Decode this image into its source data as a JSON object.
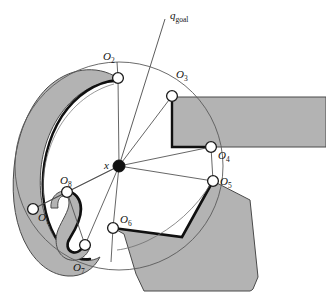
{
  "figure": {
    "type": "geometric-diagram",
    "canvas": {
      "width": 326,
      "height": 306
    },
    "colors": {
      "obstacle_fill": "#b3b3b3",
      "obstacle_stroke": "#3c3c3c",
      "highlight_stroke": "#111111",
      "ray_stroke": "#4d4d4d",
      "circle_stroke": "#555555",
      "node_fill": "#ffffff",
      "node_stroke": "#1a1a1a",
      "center_fill": "#111111",
      "background": "#ffffff"
    },
    "center": {
      "label": "x",
      "label_x": 104,
      "label_y": 160,
      "cx": 119,
      "cy": 166,
      "r": 6
    },
    "goal": {
      "label": "q",
      "sublabel": "goal",
      "label_x": 170,
      "label_y": 10,
      "line_from": {
        "x": 119,
        "y": 166
      },
      "line_to": {
        "x": 165,
        "y": 19
      }
    },
    "visibility_circle": {
      "cx": 119,
      "cy": 166,
      "r": 104
    },
    "nodes": [
      {
        "id": "O1",
        "label": "O",
        "sub": "1",
        "cx": 33,
        "cy": 209,
        "label_x": 38,
        "label_y": 212
      },
      {
        "id": "O2",
        "label": "O",
        "sub": "2",
        "cx": 118,
        "cy": 78,
        "label_x": 103,
        "label_y": 51
      },
      {
        "id": "O3",
        "label": "O",
        "sub": "3",
        "cx": 172,
        "cy": 96,
        "label_x": 176,
        "label_y": 69
      },
      {
        "id": "O4",
        "label": "O",
        "sub": "4",
        "cx": 211,
        "cy": 147,
        "label_x": 218,
        "label_y": 150
      },
      {
        "id": "O5",
        "label": "O",
        "sub": "5",
        "cx": 213,
        "cy": 181,
        "label_x": 220,
        "label_y": 176
      },
      {
        "id": "O6",
        "label": "O",
        "sub": "6",
        "cx": 113,
        "cy": 228,
        "label_x": 120,
        "label_y": 214
      },
      {
        "id": "O7",
        "label": "O",
        "sub": "7",
        "cx": 85,
        "cy": 245,
        "label_x": 73,
        "label_y": 262
      },
      {
        "id": "O8",
        "label": "O",
        "sub": "8",
        "cx": 67,
        "cy": 192,
        "label_x": 60,
        "label_y": 175
      }
    ],
    "rays": [
      {
        "from": "x",
        "to": "O1"
      },
      {
        "from": "x",
        "to": "O2"
      },
      {
        "from": "x",
        "to": "O3"
      },
      {
        "from": "x",
        "to": "O4"
      },
      {
        "from": "x",
        "to": "O5"
      },
      {
        "from": "x",
        "to": "O6"
      },
      {
        "from": "x",
        "to": "O7"
      },
      {
        "from": "x",
        "to": "O8"
      }
    ],
    "obstacles": [
      {
        "id": "crescent-blob",
        "kind": "curved-blob",
        "position": "left"
      },
      {
        "id": "u-blob",
        "kind": "curved-blob",
        "position": "lower-left-inner"
      },
      {
        "id": "top-right-rectangle",
        "kind": "polygon",
        "position": "right"
      },
      {
        "id": "bottom-right-polygon",
        "kind": "polygon",
        "position": "lower-right"
      }
    ]
  }
}
